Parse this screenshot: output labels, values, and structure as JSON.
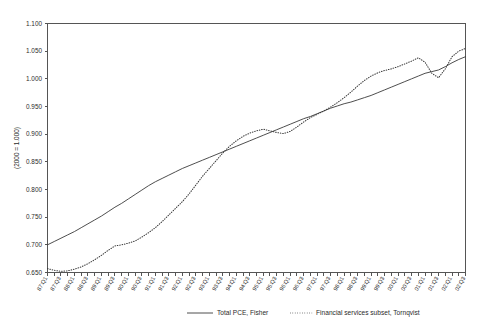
{
  "chart_data": {
    "type": "line",
    "title": "",
    "xlabel": "",
    "ylabel": "(2000 = 1.000)",
    "ylim": [
      0.65,
      1.1
    ],
    "ytick_step": 0.05,
    "ytick_labels": [
      "0.650",
      "0.700",
      "0.750",
      "0.800",
      "0.850",
      "0.900",
      "0.950",
      "1.000",
      "1.050",
      "1.100"
    ],
    "grid": false,
    "legend_position": "bottom",
    "x": [
      "87:Q1",
      "87:Q2",
      "87:Q3",
      "87:Q4",
      "88:Q1",
      "88:Q2",
      "88:Q3",
      "88:Q4",
      "89:Q1",
      "89:Q2",
      "89:Q3",
      "89:Q4",
      "90:Q1",
      "90:Q2",
      "90:Q3",
      "90:Q4",
      "91:Q1",
      "91:Q2",
      "91:Q3",
      "91:Q4",
      "92:Q1",
      "92:Q2",
      "92:Q3",
      "92:Q4",
      "93:Q1",
      "93:Q2",
      "93:Q3",
      "93:Q4",
      "94:Q1",
      "94:Q2",
      "94:Q3",
      "94:Q4",
      "95:Q1",
      "95:Q2",
      "95:Q3",
      "95:Q4",
      "96:Q1",
      "96:Q2",
      "96:Q3",
      "96:Q4",
      "97:Q1",
      "97:Q2",
      "97:Q3",
      "97:Q4",
      "98:Q1",
      "98:Q2",
      "98:Q3",
      "98:Q4",
      "99:Q1",
      "99:Q2",
      "99:Q3",
      "99:Q4",
      "00:Q1",
      "00:Q2",
      "00:Q3",
      "00:Q4",
      "01:Q1",
      "01:Q2",
      "01:Q3",
      "01:Q4",
      "02:Q1",
      "02:Q2",
      "02:Q3"
    ],
    "xtick_labels_shown": [
      "87:Q1",
      "87:Q3",
      "88:Q1",
      "88:Q3",
      "89:Q1",
      "89:Q3",
      "90:Q1",
      "90:Q3",
      "91:Q1",
      "91:Q3",
      "92:Q1",
      "92:Q3",
      "93:Q1",
      "93:Q3",
      "94:Q1",
      "94:Q3",
      "95:Q1",
      "95:Q3",
      "96:Q1",
      "96:Q3",
      "97:Q1",
      "97:Q3",
      "98:Q1",
      "98:Q3",
      "99:Q1",
      "99:Q3",
      "00:Q1",
      "00:Q3",
      "01:Q1",
      "01:Q3",
      "02:Q1",
      "02:Q3"
    ],
    "series": [
      {
        "name": "Total PCE,  Fisher",
        "style": "solid",
        "color": "#3a3a3a",
        "values": [
          0.7,
          0.706,
          0.712,
          0.718,
          0.724,
          0.731,
          0.738,
          0.745,
          0.752,
          0.76,
          0.768,
          0.775,
          0.783,
          0.791,
          0.799,
          0.807,
          0.814,
          0.82,
          0.826,
          0.832,
          0.838,
          0.843,
          0.848,
          0.853,
          0.858,
          0.863,
          0.868,
          0.873,
          0.878,
          0.883,
          0.888,
          0.893,
          0.898,
          0.903,
          0.908,
          0.913,
          0.918,
          0.923,
          0.928,
          0.932,
          0.937,
          0.942,
          0.947,
          0.951,
          0.955,
          0.958,
          0.962,
          0.966,
          0.97,
          0.975,
          0.98,
          0.985,
          0.99,
          0.995,
          1.0,
          1.005,
          1.01,
          1.013,
          1.016,
          1.022,
          1.029,
          1.035,
          1.04
        ]
      },
      {
        "name": "Financial services subset, Tornqvist",
        "style": "dotted",
        "color": "#3a3a3a",
        "values": [
          0.657,
          0.654,
          0.652,
          0.653,
          0.656,
          0.66,
          0.666,
          0.673,
          0.681,
          0.69,
          0.698,
          0.7,
          0.703,
          0.707,
          0.714,
          0.722,
          0.731,
          0.742,
          0.754,
          0.766,
          0.778,
          0.792,
          0.808,
          0.824,
          0.838,
          0.852,
          0.866,
          0.878,
          0.888,
          0.896,
          0.902,
          0.906,
          0.909,
          0.906,
          0.903,
          0.901,
          0.905,
          0.913,
          0.922,
          0.93,
          0.936,
          0.942,
          0.949,
          0.957,
          0.966,
          0.976,
          0.987,
          0.997,
          1.005,
          1.011,
          1.015,
          1.018,
          1.022,
          1.027,
          1.032,
          1.038,
          1.03,
          1.01,
          1.002,
          1.018,
          1.04,
          1.05,
          1.055
        ]
      }
    ]
  },
  "legend": {
    "entries": [
      {
        "label": "Total PCE,  Fisher",
        "style": "solid"
      },
      {
        "label": "Financial services subset, Tornqvist",
        "style": "dotted"
      }
    ]
  }
}
